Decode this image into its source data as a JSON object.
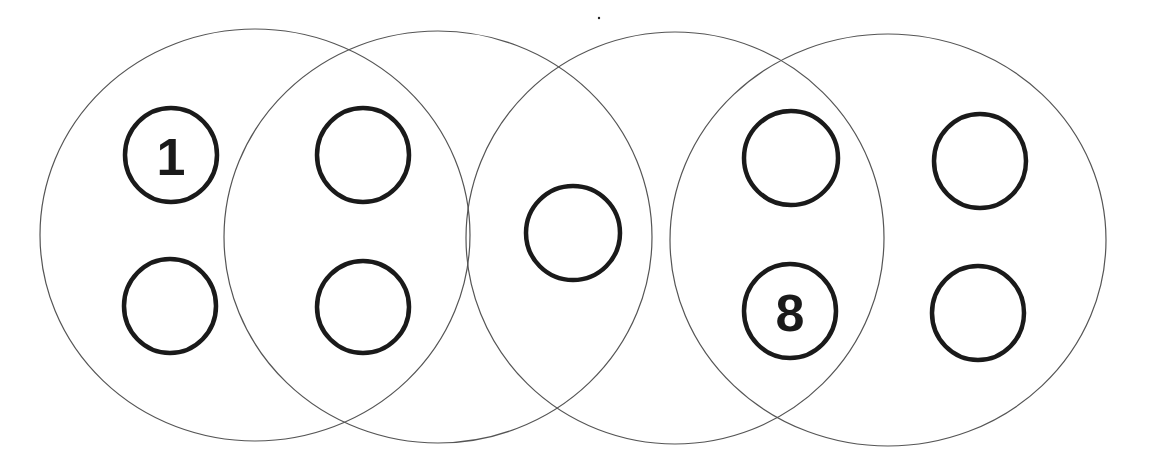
{
  "diagram": {
    "type": "overlapping-groups-with-slots",
    "stroke_colors": {
      "group": "#555555",
      "slot": "#1a1a1a"
    },
    "groups": [
      {
        "id": "group-1",
        "cx": 255,
        "cy": 235,
        "rx": 215,
        "ry": 206
      },
      {
        "id": "group-2",
        "cx": 438,
        "cy": 237,
        "rx": 214,
        "ry": 206
      },
      {
        "id": "group-3",
        "cx": 675,
        "cy": 238,
        "rx": 209,
        "ry": 206
      },
      {
        "id": "group-4",
        "cx": 888,
        "cy": 240,
        "rx": 218,
        "ry": 206
      }
    ],
    "slots": [
      {
        "id": "slot-1",
        "cx": 171,
        "cy": 155,
        "r": 47,
        "label": "1"
      },
      {
        "id": "slot-2",
        "cx": 170,
        "cy": 306,
        "r": 47,
        "label": ""
      },
      {
        "id": "slot-3",
        "cx": 363,
        "cy": 155,
        "r": 47,
        "label": ""
      },
      {
        "id": "slot-4",
        "cx": 363,
        "cy": 307,
        "r": 47,
        "label": ""
      },
      {
        "id": "slot-5",
        "cx": 573,
        "cy": 233,
        "r": 47,
        "label": ""
      },
      {
        "id": "slot-6",
        "cx": 791,
        "cy": 158,
        "r": 47,
        "label": ""
      },
      {
        "id": "slot-7",
        "cx": 790,
        "cy": 311,
        "r": 47,
        "label": "8"
      },
      {
        "id": "slot-8",
        "cx": 980,
        "cy": 161,
        "r": 47,
        "label": ""
      },
      {
        "id": "slot-9",
        "cx": 978,
        "cy": 313,
        "r": 47,
        "label": ""
      }
    ]
  }
}
